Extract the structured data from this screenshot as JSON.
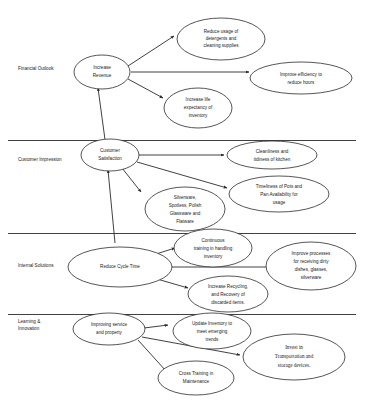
{
  "diagram": {
    "perspectives": [
      {
        "id": "financial",
        "label": "Financial Outlook"
      },
      {
        "id": "customer",
        "label": "Customer Impression"
      },
      {
        "id": "internal",
        "label": "Internal Solutions"
      },
      {
        "id": "learning",
        "label_line1": "Learning &",
        "label_line2": "Innovation"
      }
    ],
    "nodes": {
      "increase_revenue": {
        "lines": [
          "Increase",
          "Revenue"
        ]
      },
      "reduce_detergents": {
        "lines": [
          "Reduce usage of",
          "detergents and",
          "cleaning supplies"
        ]
      },
      "improve_efficiency": {
        "lines": [
          "Improve efficiency to",
          "reduce hours"
        ]
      },
      "increase_life": {
        "lines": [
          "Increase life",
          "expectancy of",
          "inventory"
        ]
      },
      "customer_satisfaction": {
        "lines": [
          "Customer",
          "Satisfaction"
        ]
      },
      "cleanliness": {
        "lines": [
          "Cleanliness and",
          "tidiness of kitchen"
        ]
      },
      "timeliness_pots": {
        "lines": [
          "Timeliness of Pots and",
          "Pan Availability for",
          "usage"
        ]
      },
      "silverware": {
        "lines": [
          "Silverware,",
          "Spotless, Polish",
          "Glassware and",
          "Flatware"
        ]
      },
      "reduce_cycle_time": {
        "lines": [
          "Reduce Cycle Time"
        ]
      },
      "continuous_training": {
        "lines": [
          "Continuous",
          "training in handling",
          "inventory"
        ]
      },
      "improve_receiving": {
        "lines": [
          "Improve processes",
          "for receiving dirty",
          "dishes, glasses,",
          "silverware"
        ]
      },
      "increase_recycling": {
        "lines": [
          "Increase Recycling,",
          "and Recovery of",
          "discarded items."
        ]
      },
      "improving_service": {
        "lines": [
          "Improving service",
          "and property"
        ]
      },
      "update_inventory": {
        "lines": [
          "Update Inventory to",
          "meet emerging",
          "trends"
        ]
      },
      "invest_transport": {
        "lines": [
          "Invest in",
          "Transportation and",
          "storage devices."
        ]
      },
      "cross_training": {
        "lines": [
          "Cross Training in",
          "Maintenance"
        ]
      }
    },
    "colors": {
      "stroke": "#2b2b2b",
      "fill": "#ffffff",
      "text": "#1a1a1a",
      "background": "#ffffff"
    }
  }
}
